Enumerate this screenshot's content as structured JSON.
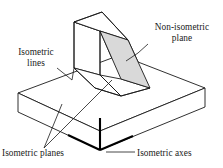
{
  "figure": {
    "type": "isometric-drawing",
    "background_color": "#ffffff",
    "line_color": "#1a1a1a",
    "shaded_plane_fill": "#d9d9d9",
    "axes_color": "#000000"
  },
  "labels": {
    "non_isometric_plane": {
      "line1": "Non-isometric",
      "line2": "plane"
    },
    "isometric_lines": {
      "line1": "Isometric",
      "line2": "lines"
    },
    "isometric_planes": "Isometric planes",
    "isometric_axes": "Isometric axes"
  }
}
